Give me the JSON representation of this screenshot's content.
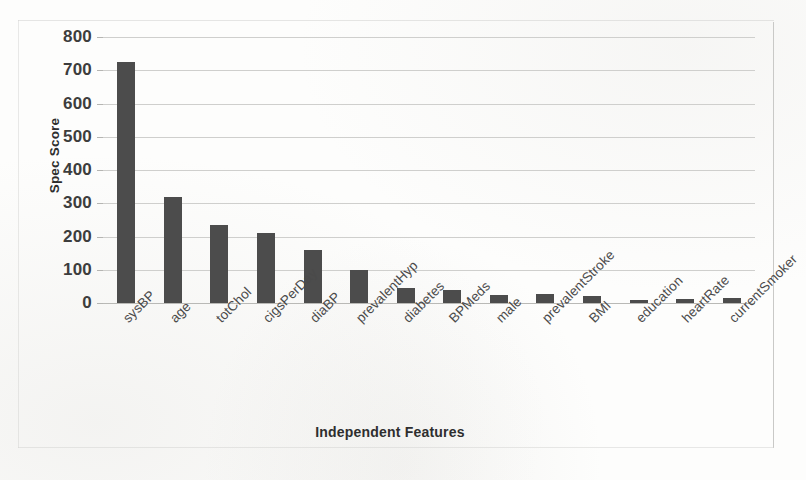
{
  "chart_data": {
    "type": "bar",
    "title": "",
    "xlabel": "Independent Features",
    "ylabel": "Spec Score",
    "ylim": [
      0,
      800
    ],
    "yticks": [
      0,
      100,
      200,
      300,
      400,
      500,
      600,
      700,
      800
    ],
    "grid": true,
    "legend": "none",
    "bar_color": "#4c4c4c",
    "gridline_color": "#cfcfcd",
    "categories": [
      "sysBP",
      "age",
      "totChol",
      "cigsPerDay",
      "diaBP",
      "prevalentHyp",
      "diabetes",
      "BPMeds",
      "male",
      "prevalentStroke",
      "BMI",
      "education",
      "heartRate",
      "currentSmoker"
    ],
    "values": [
      725,
      320,
      236,
      212,
      160,
      100,
      45,
      38,
      25,
      27,
      22,
      10,
      13,
      16
    ]
  }
}
